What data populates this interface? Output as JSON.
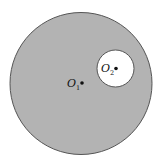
{
  "figure": {
    "large_circle": {
      "label": "O",
      "label_sub": "1",
      "cx": 81,
      "cy": 83.5,
      "r": 71,
      "fill": "#b3b3b3",
      "stroke": "#555555"
    },
    "small_circle": {
      "label": "O",
      "label_sub": "2",
      "cx": 115.5,
      "cy": 68.5,
      "r": 18.5,
      "fill": "#ffffff",
      "stroke": "#555555"
    },
    "dot_color": "#111111"
  }
}
